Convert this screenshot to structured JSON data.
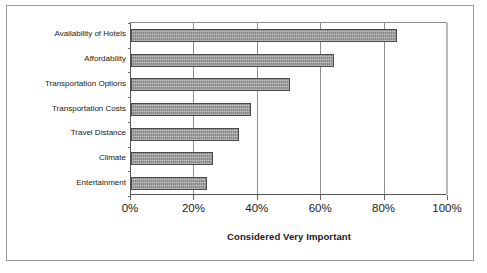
{
  "chart_data": {
    "type": "bar",
    "orientation": "horizontal",
    "title": "",
    "xlabel": "Considered Very Important",
    "ylabel": "",
    "categories": [
      "Availability of Hotels",
      "Affordability",
      "Transportation Options",
      "Transportation Costs",
      "Travel Distance",
      "Climate",
      "Entertainment"
    ],
    "values": [
      84,
      64,
      50,
      38,
      34,
      26,
      24
    ],
    "xlim": [
      0,
      100
    ],
    "xticks": [
      0,
      20,
      40,
      60,
      80,
      100
    ],
    "xticklabels": [
      "0%",
      "20%",
      "40%",
      "60%",
      "80%",
      "100%"
    ],
    "grid": "vertical",
    "legend": "none",
    "bar_color": "#8e8e8e",
    "bar_border_color": "#4a4a4a",
    "axis_color": "#555555",
    "gridline_color": "#8f8f8f",
    "background_color": "#ffffff",
    "frame_border_color": "#9a9a9a"
  }
}
